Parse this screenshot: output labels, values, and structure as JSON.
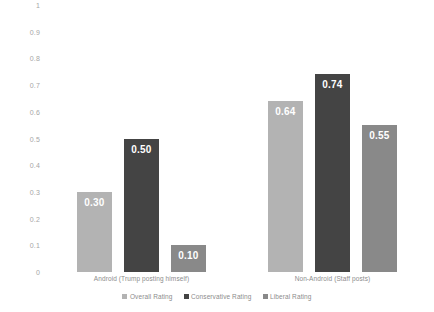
{
  "chart_data": {
    "type": "bar",
    "title": "",
    "subtitle": "",
    "xlabel": "",
    "ylabel": "",
    "ylim": [
      0,
      1
    ],
    "grid": false,
    "legend_position": "bottom",
    "categories": [
      "Android (Trump posting himself)",
      "Non-Android (Staff posts)"
    ],
    "series": [
      {
        "name": "Overall Rating",
        "color": "#b3b3b3",
        "values": [
          0.3,
          0.64
        ],
        "labels": [
          "0.30",
          "0.64"
        ]
      },
      {
        "name": "Conservative Rating",
        "color": "#444444",
        "values": [
          0.5,
          0.74
        ],
        "labels": [
          "0.50",
          "0.74"
        ]
      },
      {
        "name": "Liberal Rating",
        "color": "#898989",
        "values": [
          0.1,
          0.55
        ],
        "labels": [
          "0.10",
          "0.55"
        ]
      }
    ],
    "y_ticks": [
      "1",
      "0.9",
      "0.8",
      "0.7",
      "0.6",
      "0.5",
      "0.4",
      "0.3",
      "0.2",
      "0.1",
      "0"
    ],
    "y_tick_values": [
      1,
      0.9,
      0.8,
      0.7,
      0.6,
      0.5,
      0.4,
      0.3,
      0.2,
      0.1,
      0
    ]
  },
  "colors": {
    "background": "#ffffff",
    "tick_text": "#a6a6a6",
    "label_text": "#8c8c8c",
    "value_text": "#ffffff"
  }
}
